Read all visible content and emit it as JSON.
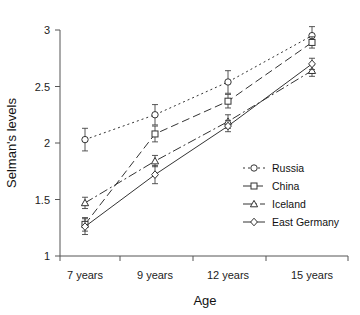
{
  "chart_data": {
    "type": "line",
    "title": "",
    "xlabel": "Age",
    "ylabel": "Selman's levels",
    "categories": [
      "7 years",
      "9 years",
      "12 years",
      "15 years"
    ],
    "x_tick_labels": [
      "7 years",
      "9 years",
      "12 years",
      "15 years"
    ],
    "y_tick_labels": [
      "1",
      "1.5",
      "2",
      "2.5",
      "3"
    ],
    "y_ticks": [
      1,
      1.5,
      2,
      2.5,
      3
    ],
    "ylim": [
      1,
      3
    ],
    "grid": false,
    "legend_position": "center-right",
    "error_bars": true,
    "series": [
      {
        "name": "Russia",
        "marker": "circle",
        "dash": "dotted",
        "values": [
          2.03,
          2.25,
          2.54,
          2.95
        ],
        "errors": [
          0.1,
          0.09,
          0.1,
          0.08
        ]
      },
      {
        "name": "China",
        "marker": "square",
        "dash": "dashed",
        "values": [
          1.28,
          2.08,
          2.37,
          2.89
        ],
        "errors": [
          0.06,
          0.07,
          0.06,
          0.05
        ]
      },
      {
        "name": "Iceland",
        "marker": "triangle",
        "dash": "dashdot",
        "values": [
          1.47,
          1.84,
          2.19,
          2.64
        ],
        "errors": [
          0.05,
          0.05,
          0.06,
          0.05
        ]
      },
      {
        "name": "East Germany",
        "marker": "diamond",
        "dash": "solid",
        "values": [
          1.26,
          1.72,
          2.15,
          2.7
        ],
        "errors": [
          0.07,
          0.08,
          0.05,
          0.05
        ]
      }
    ]
  },
  "legend": {
    "items": [
      {
        "label": "Russia"
      },
      {
        "label": "China"
      },
      {
        "label": "Iceland"
      },
      {
        "label": "East Germany"
      }
    ]
  }
}
